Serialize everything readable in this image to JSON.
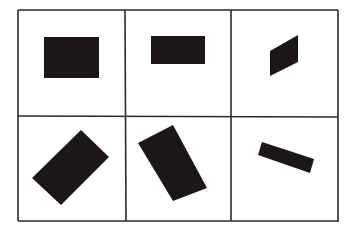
{
  "figure": {
    "colors": {
      "background": "#ffffff",
      "grid_line": "#2a2a2a",
      "shape_fill": "#1c1716"
    },
    "grid": {
      "rows": 2,
      "columns": 3
    },
    "panels": [
      {
        "row": 0,
        "col": 0,
        "shape": "rectangle",
        "orientation": "axis-aligned, landscape",
        "rotation_deg": 0
      },
      {
        "row": 0,
        "col": 1,
        "shape": "rectangle",
        "orientation": "axis-aligned, wide landscape",
        "rotation_deg": 0
      },
      {
        "row": 0,
        "col": 2,
        "shape": "parallelogram",
        "orientation": "sheared, vertical sides",
        "rotation_deg": -30
      },
      {
        "row": 1,
        "col": 0,
        "shape": "rectangle",
        "orientation": "rotated",
        "rotation_deg": -45
      },
      {
        "row": 1,
        "col": 1,
        "shape": "rectangle",
        "orientation": "rotated",
        "rotation_deg": 60
      },
      {
        "row": 1,
        "col": 2,
        "shape": "rectangle",
        "orientation": "rotated, thin bar",
        "rotation_deg": 20
      }
    ]
  }
}
